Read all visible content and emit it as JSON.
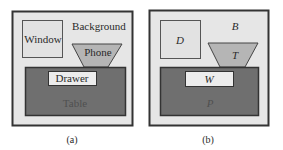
{
  "panels": [
    {
      "id": "a",
      "caption": "(a)",
      "background_label": "Background",
      "window_label": "Window",
      "phone_label": "Phone",
      "drawer_label": "Drawer",
      "table_label": "Table"
    },
    {
      "id": "b",
      "caption": "(b)",
      "background_label": "B",
      "window_label": "D",
      "phone_label": "T",
      "drawer_label": "W",
      "table_label": "P"
    }
  ],
  "colors": {
    "frame_fill": "#e6e6e6",
    "frame_stroke": "#333333",
    "window_fill": "#e2e2e2",
    "phone_fill": "#b5b5b5",
    "table_fill": "#6f6f6f",
    "drawer_fill": "#ececec"
  }
}
